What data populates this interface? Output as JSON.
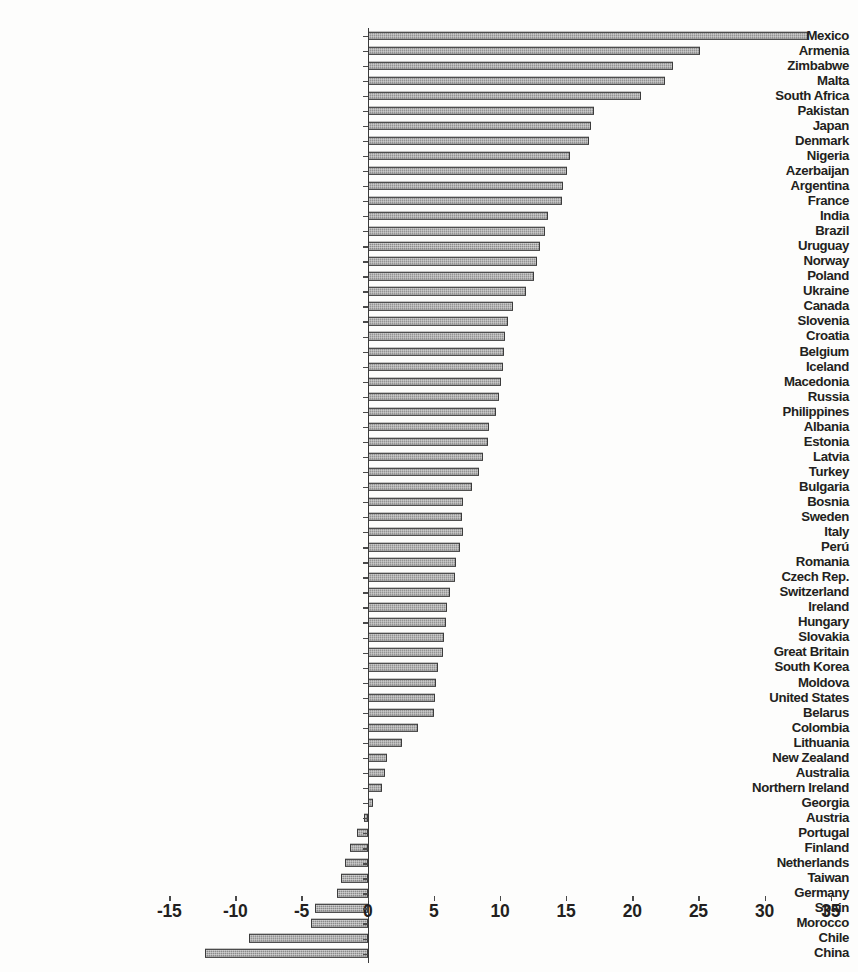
{
  "chart_data": {
    "type": "bar",
    "orientation": "horizontal",
    "title": "",
    "subtitle": "",
    "xlabel": "",
    "ylabel": "",
    "xlim": [
      -15,
      35
    ],
    "xticks": [
      -15,
      -10,
      -5,
      0,
      5,
      10,
      15,
      20,
      25,
      30,
      35
    ],
    "xtick_labels": [
      "-15",
      "-10",
      "-5",
      "0",
      "5",
      "10",
      "15",
      "20",
      "25",
      "30",
      "35"
    ],
    "grid": false,
    "legend": null,
    "bar_color": "#8a8a8a",
    "bar_edge_color": "#3c3c3c",
    "zero_line_color": "#3a3a3a",
    "categories": [
      "Mexico",
      "Armenia",
      "Zimbabwe",
      "Malta",
      "South Africa",
      "Pakistan",
      "Japan",
      "Denmark",
      "Nigeria",
      "Azerbaijan",
      "Argentina",
      "France",
      "India",
      "Brazil",
      "Uruguay",
      "Norway",
      "Poland",
      "Ukraine",
      "Canada",
      "Slovenia",
      "Croatia",
      "Belgium",
      "Iceland",
      "Macedonia",
      "Russia",
      "Philippines",
      "Albania",
      "Estonia",
      "Latvia",
      "Turkey",
      "Bulgaria",
      "Bosnia",
      "Sweden",
      "Italy",
      "Perú",
      "Romania",
      "Czech Rep.",
      "Switzerland",
      "Ireland",
      "Hungary",
      "Slovakia",
      "Great Britain",
      "South Korea",
      "Moldova",
      "United States",
      "Belarus",
      "Colombia",
      "Lithuania",
      "New Zealand",
      "Australia",
      "Northern Ireland",
      "Georgia",
      "Austria",
      "Portugal",
      "Finland",
      "Netherlands",
      "Taiwan",
      "Germany",
      "Spain",
      "Morocco",
      "Chile",
      "China"
    ],
    "values": [
      33.3,
      25.1,
      23.1,
      22.5,
      20.7,
      17.1,
      16.9,
      16.7,
      15.3,
      15.1,
      14.8,
      14.7,
      13.6,
      13.4,
      13.0,
      12.8,
      12.6,
      12.0,
      11.0,
      10.6,
      10.4,
      10.3,
      10.2,
      10.1,
      9.9,
      9.7,
      9.2,
      9.1,
      8.7,
      8.4,
      7.9,
      7.2,
      7.1,
      7.2,
      7.0,
      6.7,
      6.6,
      6.2,
      6.0,
      5.9,
      5.8,
      5.7,
      5.3,
      5.2,
      5.1,
      5.0,
      3.8,
      2.6,
      1.5,
      1.3,
      1.1,
      0.4,
      -0.3,
      -0.8,
      -1.3,
      -1.7,
      -2.0,
      -2.3,
      -4.0,
      -4.3,
      -9.0,
      -12.3
    ]
  },
  "axis": {
    "zero_value": 0
  }
}
